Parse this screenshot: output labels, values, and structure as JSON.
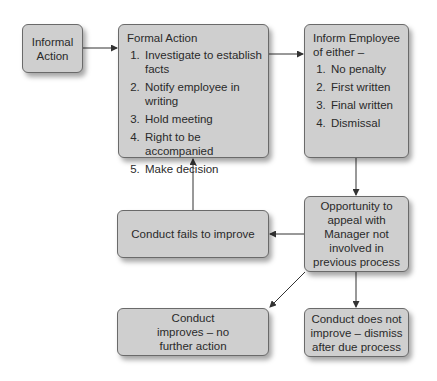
{
  "diagram": {
    "nodes": {
      "informal": {
        "label": "Informal Action"
      },
      "formal": {
        "title": "Formal Action",
        "items": [
          "Investigate to establish facts",
          "Notify employee in writing",
          "Hold meeting",
          "Right to be accompanied",
          "Make decision"
        ]
      },
      "inform": {
        "title": "Inform Employee of either –",
        "items": [
          "No penalty",
          "First written",
          "Final written",
          "Dismissal"
        ]
      },
      "appeal": {
        "label": "Opportunity to appeal with Manager not involved in previous process"
      },
      "fails": {
        "label": "Conduct fails to improve"
      },
      "improves": {
        "label": "Conduct improves – no further action"
      },
      "dismiss": {
        "label": "Conduct does not improve – dismiss after due process"
      }
    },
    "edges": [
      {
        "from": "informal",
        "to": "formal"
      },
      {
        "from": "formal",
        "to": "inform"
      },
      {
        "from": "inform",
        "to": "appeal"
      },
      {
        "from": "appeal",
        "to": "fails"
      },
      {
        "from": "fails",
        "to": "formal"
      },
      {
        "from": "appeal",
        "to": "improves"
      },
      {
        "from": "appeal",
        "to": "dismiss"
      }
    ],
    "colors": {
      "box_fill": "#cfcfcf",
      "box_border": "#6a6a6a",
      "arrow": "#333333"
    }
  }
}
